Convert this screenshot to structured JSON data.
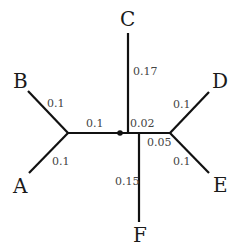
{
  "diagram": {
    "type": "unrooted phylogenetic tree",
    "leaves": [
      {
        "label": "A",
        "branch_length": "0.1"
      },
      {
        "label": "B",
        "branch_length": "0.1"
      },
      {
        "label": "C",
        "branch_length": "0.17"
      },
      {
        "label": "D",
        "branch_length": "0.1"
      },
      {
        "label": "E",
        "branch_length": "0.1"
      },
      {
        "label": "F",
        "branch_length": "0.15"
      }
    ],
    "internal_branches": [
      {
        "between": "AB-node to root",
        "branch_length": "0.1"
      },
      {
        "between": "C-node to F-node",
        "branch_length": "0.02"
      },
      {
        "between": "F-node to DE-node",
        "branch_length": "0.05"
      }
    ],
    "root_marker": "dot"
  }
}
